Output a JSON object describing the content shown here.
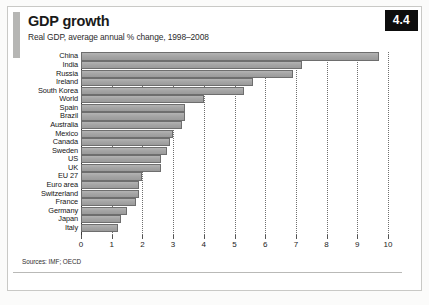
{
  "header": {
    "title": "GDP growth",
    "subtitle": "Real GDP, average annual % change, 1998–2008",
    "badge": "4.4"
  },
  "footer": {
    "source": "Sources: IMF; OECD"
  },
  "colors": {
    "bar_fill": "#a5a5a5",
    "bar_border": "#6e6e6e",
    "badge_bg": "#0d0d0d",
    "accent_bar": "#b6b6b4",
    "grid": "#6f6f6f"
  },
  "chart_data": {
    "type": "bar",
    "orientation": "horizontal",
    "title": "GDP growth",
    "subtitle": "Real GDP, average annual % change, 1998–2008",
    "xlabel": "",
    "ylabel": "",
    "xlim": [
      0,
      10
    ],
    "xticks": [
      0,
      1,
      2,
      3,
      4,
      5,
      6,
      7,
      8,
      9,
      10
    ],
    "xtick_labels": [
      "0",
      "1",
      "2",
      "3",
      "4",
      "5",
      "6",
      "7",
      "8",
      "9",
      "10"
    ],
    "grid": true,
    "grid_axis": "x",
    "legend": false,
    "categories": [
      "China",
      "India",
      "Russia",
      "Ireland",
      "South Korea",
      "World",
      "Spain",
      "Brazil",
      "Australia",
      "Mexico",
      "Canada",
      "Sweden",
      "US",
      "UK",
      "EU 27",
      "Euro area",
      "Switzerland",
      "France",
      "Germany",
      "Japan",
      "Italy"
    ],
    "values": [
      9.7,
      7.2,
      6.9,
      5.6,
      5.3,
      4.0,
      3.4,
      3.4,
      3.3,
      3.0,
      2.9,
      2.8,
      2.6,
      2.6,
      2.0,
      1.9,
      1.9,
      1.8,
      1.5,
      1.3,
      1.2
    ],
    "series": [
      {
        "name": "Real GDP average annual % change 1998-2008",
        "values": [
          9.7,
          7.2,
          6.9,
          5.6,
          5.3,
          4.0,
          3.4,
          3.4,
          3.3,
          3.0,
          2.9,
          2.8,
          2.6,
          2.6,
          2.0,
          1.9,
          1.9,
          1.8,
          1.5,
          1.3,
          1.2
        ]
      }
    ]
  }
}
